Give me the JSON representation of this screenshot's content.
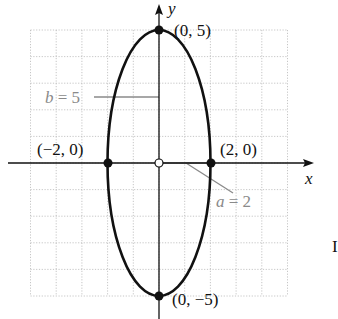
{
  "diagram": {
    "type": "ellipse-graph",
    "equation_params": {
      "a": 2,
      "b": 5,
      "center": [
        0,
        0
      ]
    },
    "axes": {
      "x_label": "x",
      "y_label": "y"
    },
    "grid": {
      "x_range": [
        -5,
        5
      ],
      "y_range": [
        -5,
        5
      ],
      "step": 1,
      "style": "dotted"
    },
    "points": [
      {
        "id": "top",
        "coords": [
          0,
          5
        ],
        "label": "(0, 5)",
        "filled": true
      },
      {
        "id": "bottom",
        "coords": [
          0,
          -5
        ],
        "label": "(0, −5)",
        "filled": true
      },
      {
        "id": "left",
        "coords": [
          -2,
          0
        ],
        "label": "(−2, 0)",
        "filled": true
      },
      {
        "id": "right",
        "coords": [
          2,
          0
        ],
        "label": "(2, 0)",
        "filled": true
      },
      {
        "id": "center",
        "coords": [
          0,
          0
        ],
        "label": "",
        "filled": false
      }
    ],
    "annotations": {
      "b_label": "b = 5",
      "a_label": "a = 2"
    },
    "colors": {
      "curve": "#111111",
      "annotation": "#8a8a8a",
      "grid": "#b8b8b8"
    },
    "edge_fragment": "I"
  }
}
